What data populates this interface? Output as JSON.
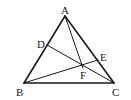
{
  "diagram": {
    "type": "geometry",
    "points": {
      "A": {
        "label": "A",
        "x": 65,
        "y": 16,
        "label_x": 61,
        "label_y": 14
      },
      "B": {
        "label": "B",
        "x": 24,
        "y": 83,
        "label_x": 16,
        "label_y": 96
      },
      "C": {
        "label": "C",
        "x": 114,
        "y": 83,
        "label_x": 112,
        "label_y": 96
      },
      "D": {
        "label": "D",
        "x": 47,
        "y": 45,
        "label_x": 37,
        "label_y": 48
      },
      "E": {
        "label": "E",
        "x": 98,
        "y": 60,
        "label_x": 100,
        "label_y": 61
      },
      "F": {
        "label": "F",
        "x": 83,
        "y": 68,
        "label_x": 80,
        "label_y": 79
      }
    },
    "segments": [
      {
        "name": "AB",
        "from": "A",
        "to": "B",
        "width": 1.6
      },
      {
        "name": "AC",
        "from": "A",
        "to": "C",
        "width": 1.6
      },
      {
        "name": "BC",
        "from": "B",
        "to": "C",
        "width": 1.6
      },
      {
        "name": "DC",
        "from": "D",
        "to": "C",
        "width": 1
      },
      {
        "name": "BE",
        "from": "B",
        "to": "E",
        "width": 1
      },
      {
        "name": "AF",
        "from": "A",
        "to": "F",
        "width": 1
      }
    ]
  }
}
